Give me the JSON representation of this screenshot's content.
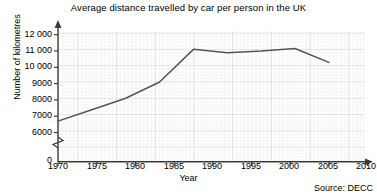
{
  "chart_data": {
    "type": "line",
    "title": "Average distance travelled by car per person in the UK",
    "xlabel": "Year",
    "ylabel": "Number of kilometres",
    "source": "Source: DECC",
    "grid": true,
    "legend": null,
    "axis_break": true,
    "xlim": [
      1970,
      2012
    ],
    "ylim": [
      6000,
      12000
    ],
    "y_zero_label": "0",
    "xticks": [
      1970,
      1975,
      1980,
      1985,
      1990,
      1995,
      2000,
      2005,
      2010
    ],
    "xtick_labels": [
      "1970",
      "1975",
      "1980",
      "1985",
      "1990",
      "1995",
      "2000",
      "2005",
      "2010"
    ],
    "yticks": [
      6000,
      7000,
      8000,
      9000,
      10000,
      11000,
      12000
    ],
    "ytick_labels": [
      "6000",
      "7000",
      "8000",
      "9000",
      "10 000",
      "11 000",
      "12 000"
    ],
    "x": [
      1970,
      1975,
      1980,
      1985,
      1990,
      1995,
      2000,
      2005,
      2010
    ],
    "values": [
      6700,
      7400,
      8100,
      9100,
      11100,
      10900,
      11000,
      11150,
      10300
    ],
    "series": [
      {
        "name": "Average distance travelled by car per person",
        "color": "#555555",
        "values": [
          6700,
          7400,
          8100,
          9100,
          11100,
          10900,
          11000,
          11150,
          10300
        ]
      }
    ],
    "colors": {
      "line": "#555555",
      "grid_minor": "#d9d9dc",
      "grid_major": "#bdbdc4",
      "axis": "#3a3a3a",
      "text": "#000000",
      "background": "#ffffff"
    }
  }
}
